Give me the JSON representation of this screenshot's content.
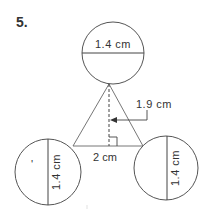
{
  "problem": {
    "number": "5."
  },
  "labels": {
    "top_circle_diameter": "1.4 cm",
    "left_circle_diameter": "1.4 cm",
    "right_circle_diameter": "1.4 cm",
    "triangle_height": "1.9 cm",
    "triangle_base": "2 cm",
    "stray_mark": "'"
  },
  "colors": {
    "stroke": "#555555",
    "text": "#333333",
    "background": "#ffffff"
  }
}
